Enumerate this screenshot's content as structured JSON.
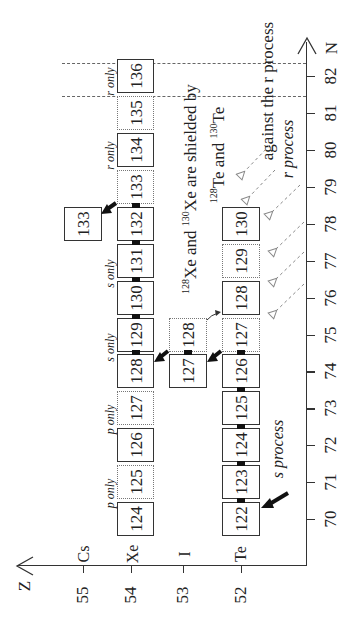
{
  "axes": {
    "n_axis_label": "N",
    "z_axis_label": "Z",
    "n_ticks": [
      "70",
      "71",
      "72",
      "73",
      "74",
      "75",
      "76",
      "77",
      "78",
      "79",
      "80",
      "81",
      "82"
    ],
    "z_ticks": [
      "52",
      "53",
      "54",
      "55"
    ],
    "element_labels": {
      "Cs": "Cs",
      "Xe": "Xe",
      "I": "I",
      "Te": "Te"
    }
  },
  "rows": {
    "Xe": [
      "124",
      "125",
      "126",
      "127",
      "128",
      "129",
      "130",
      "131",
      "132",
      "133",
      "134",
      "135",
      "136"
    ],
    "I": [
      "127",
      "128"
    ],
    "Te": [
      "122",
      "123",
      "124",
      "125",
      "126",
      "127",
      "128",
      "129",
      "130"
    ],
    "Cs": [
      "133"
    ]
  },
  "notes": {
    "p_only_1": "p only",
    "p_only_2": "p only",
    "s_only_1": "s only",
    "s_only_2": "s only",
    "r_only_1": "r only",
    "r_only_2": "r only",
    "s_process": "s process",
    "r_process": "r process"
  },
  "annotation": {
    "line1_sup1": "128",
    "line1_a": "Xe and ",
    "line1_sup2": "130",
    "line1_b": "Xe are shielded by",
    "line2_sup1": "128",
    "line2_a": "Te and ",
    "line2_sup2": "130",
    "line2_b": "Te",
    "line3": "against the r process"
  }
}
